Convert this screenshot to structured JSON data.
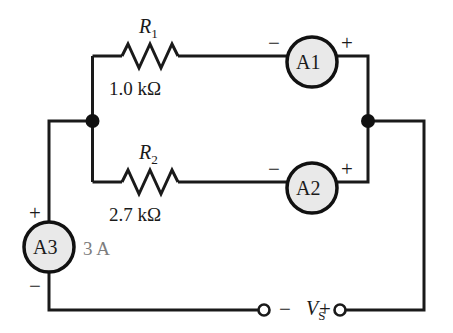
{
  "diagram": {
    "background_color": "#ffffff",
    "wire_color": "#1a1a1a",
    "meter_fill_color": "#e9e9e9",
    "meter_stroke_color": "#111111",
    "annotation_gray": "#7d7d7d"
  },
  "resistors": [
    {
      "name_main": "R",
      "name_sub": "1",
      "value": "1.0 kΩ",
      "icon": "resistor-zigzag-icon"
    },
    {
      "name_main": "R",
      "name_sub": "2",
      "value": "2.7 kΩ",
      "icon": "resistor-zigzag-icon"
    }
  ],
  "meters": [
    {
      "label": "A1",
      "minus": "−",
      "plus": "+",
      "reading": "",
      "icon": "ammeter-circle-icon"
    },
    {
      "label": "A2",
      "minus": "−",
      "plus": "+",
      "reading": "",
      "icon": "ammeter-circle-icon"
    },
    {
      "label": "A3",
      "minus": "−",
      "plus": "+",
      "reading": "3 A",
      "icon": "ammeter-circle-icon"
    }
  ],
  "source": {
    "name_main": "V",
    "name_sub": "S",
    "minus": "−",
    "plus": "+",
    "left_terminal_icon": "open-terminal-icon",
    "right_terminal_icon": "open-terminal-icon"
  },
  "nodes": {
    "left_junction_icon": "junction-dot-icon",
    "right_junction_icon": "junction-dot-icon"
  }
}
